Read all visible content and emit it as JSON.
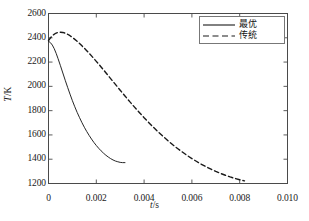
{
  "chart_data": {
    "type": "line",
    "title": "",
    "xlabel": "t/s",
    "ylabel": "T/K",
    "xlabel_var": "t",
    "xlabel_unit": "/s",
    "ylabel_var": "T",
    "ylabel_unit": "/K",
    "xlim": [
      0,
      0.01
    ],
    "ylim": [
      1200,
      2600
    ],
    "xticks": [
      "0",
      "0.002",
      "0.004",
      "0.006",
      "0.008",
      "0.010"
    ],
    "xtick_values": [
      0,
      0.002,
      0.004,
      0.006,
      0.008,
      0.01
    ],
    "yticks": [
      "1200",
      "1400",
      "1600",
      "1800",
      "2000",
      "2200",
      "2400",
      "2600"
    ],
    "ytick_values": [
      1200,
      1400,
      1600,
      1800,
      2000,
      2200,
      2400,
      2600
    ],
    "grid": false,
    "legend_position": "top-right",
    "line_color": "#1a1a1a",
    "series": [
      {
        "name": "最优",
        "style": "solid",
        "points": [
          [
            0.0,
            2372
          ],
          [
            8e-05,
            2360
          ],
          [
            0.00016,
            2340
          ],
          [
            0.00024,
            2310
          ],
          [
            0.00032,
            2272
          ],
          [
            0.0004,
            2228
          ],
          [
            0.0005,
            2170
          ],
          [
            0.0006,
            2110
          ],
          [
            0.0007,
            2050
          ],
          [
            0.0008,
            1992
          ],
          [
            0.0009,
            1936
          ],
          [
            0.001,
            1882
          ],
          [
            0.0011,
            1832
          ],
          [
            0.0012,
            1785
          ],
          [
            0.0013,
            1742
          ],
          [
            0.0014,
            1701
          ],
          [
            0.0015,
            1663
          ],
          [
            0.0016,
            1628
          ],
          [
            0.0017,
            1596
          ],
          [
            0.0018,
            1566
          ],
          [
            0.0019,
            1538
          ],
          [
            0.002,
            1513
          ],
          [
            0.0021,
            1490
          ],
          [
            0.0022,
            1469
          ],
          [
            0.0023,
            1450
          ],
          [
            0.0024,
            1433
          ],
          [
            0.0025,
            1418
          ],
          [
            0.0026,
            1405
          ],
          [
            0.0027,
            1394
          ],
          [
            0.0028,
            1385
          ],
          [
            0.0029,
            1379
          ],
          [
            0.003,
            1374
          ],
          [
            0.0031,
            1372
          ],
          [
            0.0032,
            1372
          ]
        ]
      },
      {
        "name": "传统",
        "style": "dashed",
        "points": [
          [
            0.0,
            2378
          ],
          [
            0.0001,
            2404
          ],
          [
            0.0002,
            2424
          ],
          [
            0.0003,
            2437
          ],
          [
            0.0004,
            2444
          ],
          [
            0.0005,
            2446
          ],
          [
            0.0006,
            2444
          ],
          [
            0.0007,
            2438
          ],
          [
            0.0008,
            2429
          ],
          [
            0.0009,
            2417
          ],
          [
            0.001,
            2403
          ],
          [
            0.0012,
            2371
          ],
          [
            0.0014,
            2334
          ],
          [
            0.0016,
            2294
          ],
          [
            0.0018,
            2251
          ],
          [
            0.002,
            2206
          ],
          [
            0.0022,
            2160
          ],
          [
            0.0024,
            2112
          ],
          [
            0.0026,
            2064
          ],
          [
            0.0028,
            2016
          ],
          [
            0.003,
            1968
          ],
          [
            0.0032,
            1921
          ],
          [
            0.0034,
            1874
          ],
          [
            0.0036,
            1829
          ],
          [
            0.0038,
            1785
          ],
          [
            0.004,
            1742
          ],
          [
            0.0042,
            1701
          ],
          [
            0.0044,
            1661
          ],
          [
            0.0046,
            1623
          ],
          [
            0.0048,
            1587
          ],
          [
            0.005,
            1552
          ],
          [
            0.0052,
            1519
          ],
          [
            0.0054,
            1488
          ],
          [
            0.0056,
            1459
          ],
          [
            0.0058,
            1431
          ],
          [
            0.006,
            1405
          ],
          [
            0.0062,
            1381
          ],
          [
            0.0064,
            1358
          ],
          [
            0.0066,
            1337
          ],
          [
            0.0068,
            1318
          ],
          [
            0.007,
            1300
          ],
          [
            0.0072,
            1283
          ],
          [
            0.0074,
            1268
          ],
          [
            0.0076,
            1254
          ],
          [
            0.0078,
            1242
          ],
          [
            0.008,
            1231
          ],
          [
            0.0082,
            1222
          ]
        ]
      }
    ]
  },
  "legend": {
    "entries": [
      {
        "label": "最优",
        "style": "solid"
      },
      {
        "label": "传统",
        "style": "dashed"
      }
    ]
  }
}
